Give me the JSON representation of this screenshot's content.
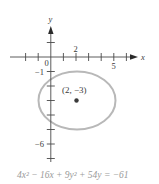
{
  "figure": {
    "axes": {
      "x_label": "x",
      "y_label": "y",
      "x_tick_labels": {
        "two": "2",
        "five": "5"
      },
      "y_tick_labels": {
        "neg_one": "−1",
        "neg_six": "−6"
      },
      "origin_label": "0",
      "x_range": [
        -3,
        7
      ],
      "y_range": [
        -7,
        2
      ]
    },
    "ellipse": {
      "center_label": "(2, −3)",
      "center": [
        2,
        -3
      ],
      "semi_axis_x": 3,
      "semi_axis_y": 2,
      "stroke_color": "#b5b5b5"
    },
    "center_point_color": "#3a3a3a",
    "equation": "4x² − 16x + 9y² + 54y = −61"
  }
}
